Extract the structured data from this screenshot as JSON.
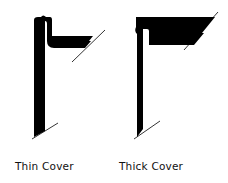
{
  "figures": [
    {
      "id": "thin",
      "label": "Thin Cover"
    },
    {
      "id": "thick",
      "label": "Thick Cover"
    }
  ],
  "colors": {
    "ink": "#000000",
    "background": "#ffffff"
  }
}
